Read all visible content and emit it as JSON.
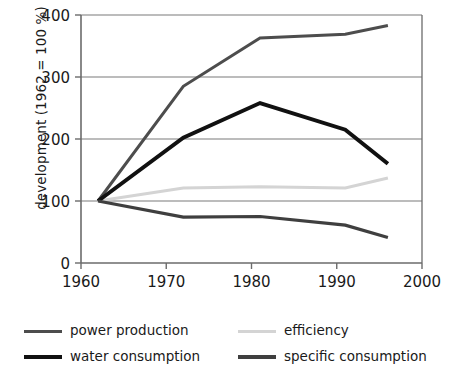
{
  "chart_data": {
    "type": "line",
    "title": "",
    "xlabel": "",
    "ylabel": "development (1962 = 100 %)",
    "xlim": [
      1960,
      2000
    ],
    "ylim": [
      0,
      400
    ],
    "xticks": [
      1960,
      1970,
      1980,
      1990,
      2000
    ],
    "yticks": [
      0,
      100,
      200,
      300,
      400
    ],
    "grid": "horizontal",
    "legend_position": "below",
    "series": [
      {
        "name": "power production",
        "color": "#4d4d4d",
        "width": 3.0,
        "x": [
          1962,
          1972,
          1981,
          1991,
          1996
        ],
        "values": [
          100,
          285,
          363,
          369,
          383
        ]
      },
      {
        "name": "efficiency",
        "color": "#d4d4d4",
        "width": 3.0,
        "x": [
          1962,
          1972,
          1981,
          1991,
          1996
        ],
        "values": [
          100,
          121,
          123,
          121,
          137
        ]
      },
      {
        "name": "water consumption",
        "color": "#111111",
        "width": 4.0,
        "x": [
          1962,
          1972,
          1981,
          1991,
          1996
        ],
        "values": [
          100,
          202,
          258,
          215,
          160
        ]
      },
      {
        "name": "specific consumption",
        "color": "#3f3f3f",
        "width": 3.2,
        "x": [
          1962,
          1972,
          1981,
          1991,
          1996
        ],
        "values": [
          100,
          74,
          75,
          61,
          41
        ]
      }
    ]
  },
  "axis": {
    "y_axis_title": "development (1962 = 100 %)",
    "x_tick_labels": [
      "1960",
      "1970",
      "1980",
      "1990",
      "2000"
    ],
    "y_tick_labels": [
      "0",
      "100",
      "200",
      "300",
      "400"
    ]
  },
  "legend": {
    "items": [
      {
        "label": "power production",
        "color": "#4d4d4d",
        "thickness": 3
      },
      {
        "label": "efficiency",
        "color": "#d4d4d4",
        "thickness": 3
      },
      {
        "label": "water consumption",
        "color": "#111111",
        "thickness": 4.5
      },
      {
        "label": "specific consumption",
        "color": "#3f3f3f",
        "thickness": 3.5
      }
    ]
  },
  "colors": {
    "axis": "#6b6b6b",
    "grid": "#7a7a7a",
    "text": "#1a1a1a",
    "background": "#ffffff"
  }
}
